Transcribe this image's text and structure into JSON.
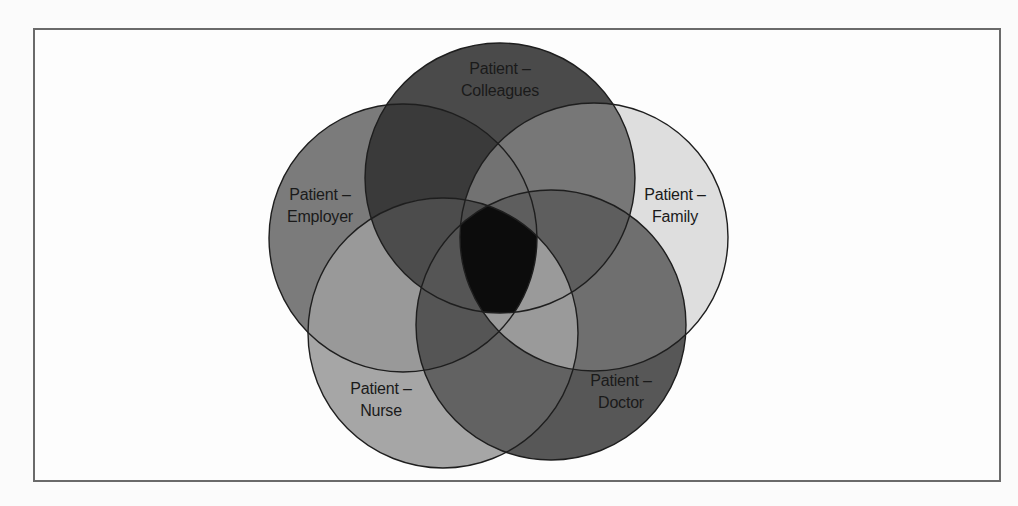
{
  "diagram": {
    "type": "venn",
    "set_count": 5,
    "sets": [
      {
        "id": "colleagues",
        "line1": "Patient –",
        "line2": "Colleagues",
        "cx": 500,
        "cy": 178,
        "r": 135,
        "fill": "#4a4a4a"
      },
      {
        "id": "employer",
        "line1": "Patient –",
        "line2": "Employer",
        "cx": 403,
        "cy": 238,
        "r": 134,
        "fill": "#7b7b7b"
      },
      {
        "id": "family",
        "line1": "Patient –",
        "line2": "Family",
        "cx": 594,
        "cy": 237,
        "r": 134,
        "fill": "#dedede"
      },
      {
        "id": "nurse",
        "line1": "Patient –",
        "line2": "Nurse",
        "cx": 443,
        "cy": 333,
        "r": 135,
        "fill": "#a6a6a6"
      },
      {
        "id": "doctor",
        "line1": "Patient –",
        "line2": "Doctor",
        "cx": 551,
        "cy": 325,
        "r": 135,
        "fill": "#575757"
      }
    ],
    "center_fill": "#0c0c0c",
    "outline_color": "#1e1e1e",
    "frame_border": "#6a6a6a"
  }
}
